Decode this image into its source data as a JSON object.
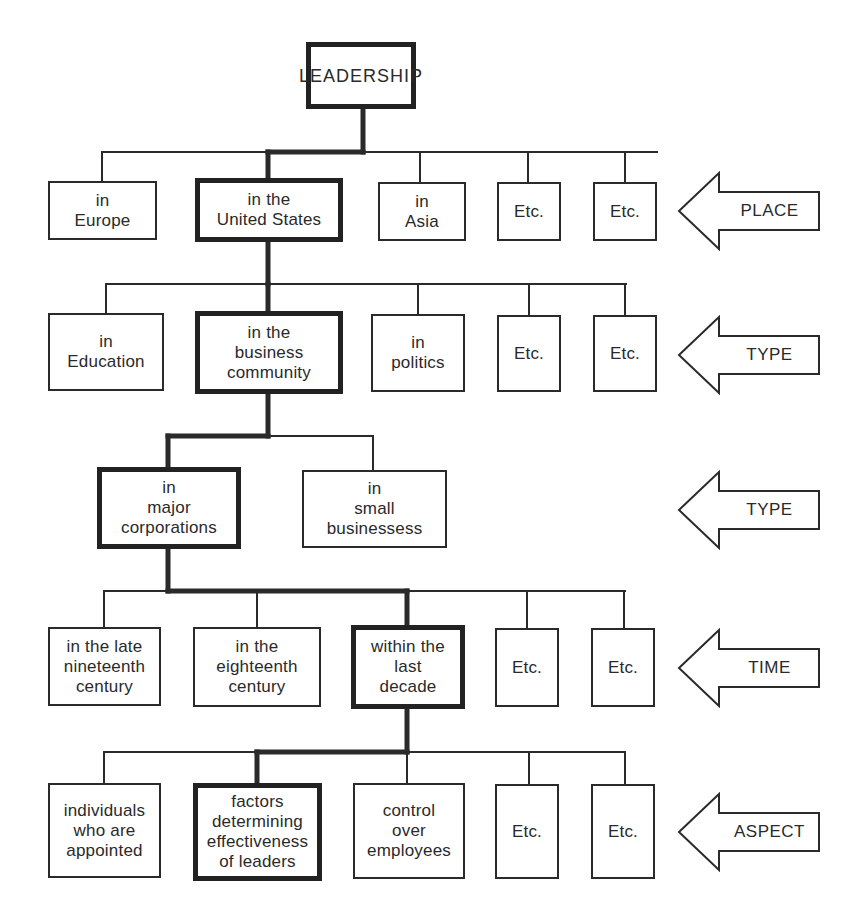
{
  "diagram": {
    "root": "LEADERSHIP",
    "colors": {
      "ink": "#2a2a2a",
      "background": "#ffffff"
    },
    "levels": [
      {
        "dimension": "PLACE",
        "nodes": [
          {
            "label": "in\nEurope",
            "selected": false
          },
          {
            "label": "in the\nUnited States",
            "selected": true
          },
          {
            "label": "in\nAsia",
            "selected": false
          },
          {
            "label": "Etc.",
            "selected": false
          },
          {
            "label": "Etc.",
            "selected": false
          }
        ]
      },
      {
        "dimension": "TYPE",
        "nodes": [
          {
            "label": "in\nEducation",
            "selected": false
          },
          {
            "label": "in the\nbusiness\ncommunity",
            "selected": true
          },
          {
            "label": "in\npolitics",
            "selected": false
          },
          {
            "label": "Etc.",
            "selected": false
          },
          {
            "label": "Etc.",
            "selected": false
          }
        ]
      },
      {
        "dimension": "TYPE",
        "nodes": [
          {
            "label": "in\nmajor\ncorporations",
            "selected": true
          },
          {
            "label": "in\nsmall\nbusinessess",
            "selected": false
          }
        ]
      },
      {
        "dimension": "TIME",
        "nodes": [
          {
            "label": "in the late\nnineteenth\ncentury",
            "selected": false
          },
          {
            "label": "in the\neighteenth\ncentury",
            "selected": false
          },
          {
            "label": "within the\nlast\ndecade",
            "selected": true
          },
          {
            "label": "Etc.",
            "selected": false
          },
          {
            "label": "Etc.",
            "selected": false
          }
        ]
      },
      {
        "dimension": "ASPECT",
        "nodes": [
          {
            "label": "individuals\nwho are\nappointed",
            "selected": false
          },
          {
            "label": "factors\ndetermining\neffectiveness\nof leaders",
            "selected": true
          },
          {
            "label": "control\nover\nemployees",
            "selected": false
          },
          {
            "label": "Etc.",
            "selected": false
          },
          {
            "label": "Etc.",
            "selected": false
          }
        ]
      }
    ]
  }
}
